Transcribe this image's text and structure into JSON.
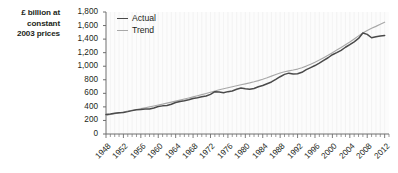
{
  "chart_data": {
    "type": "line",
    "title": "",
    "subtitle": "",
    "xlabel": "",
    "ylabel": "£ billion at constant 2003 prices",
    "ylabel_lines": [
      "£ billion at",
      "constant",
      "2003 prices"
    ],
    "ylim": [
      0,
      1800
    ],
    "ytick_step": 200,
    "ytick_labels": [
      "0",
      "200",
      "400",
      "600",
      "800",
      "1,000",
      "1,200",
      "1,400",
      "1,600",
      "1,800"
    ],
    "ytick_values": [
      0,
      200,
      400,
      600,
      800,
      1000,
      1200,
      1400,
      1600,
      1800
    ],
    "xlim": [
      1948,
      2013
    ],
    "xtick_labels": [
      "1948",
      "1952",
      "1956",
      "1960",
      "1964",
      "1968",
      "1972",
      "1976",
      "1980",
      "1984",
      "1988",
      "1992",
      "1996",
      "2000",
      "2004",
      "2008",
      "2012"
    ],
    "xtick_values": [
      1948,
      1952,
      1956,
      1960,
      1964,
      1968,
      1972,
      1976,
      1980,
      1984,
      1988,
      1992,
      1996,
      2000,
      2004,
      2008,
      2012
    ],
    "xtick_minor_step": 1,
    "grid": "vertical-faint",
    "legend_position": "top-left-inside",
    "legend": [
      "Actual",
      "Trend"
    ],
    "colors": {
      "actual": "#4a4a4a",
      "trend": "#a8a8a8",
      "axis": "#6e6e6e",
      "grid": "#ededed",
      "plot_background": "#fcfcfc",
      "text": "#231f20"
    },
    "x": [
      1948,
      1949,
      1950,
      1951,
      1952,
      1953,
      1954,
      1955,
      1956,
      1957,
      1958,
      1959,
      1960,
      1961,
      1962,
      1963,
      1964,
      1965,
      1966,
      1967,
      1968,
      1969,
      1970,
      1971,
      1972,
      1973,
      1974,
      1975,
      1976,
      1977,
      1978,
      1979,
      1980,
      1981,
      1982,
      1983,
      1984,
      1985,
      1986,
      1987,
      1988,
      1989,
      1990,
      1991,
      1992,
      1993,
      1994,
      1995,
      1996,
      1997,
      1998,
      1999,
      2000,
      2001,
      2002,
      2003,
      2004,
      2005,
      2006,
      2007,
      2008,
      2009,
      2010,
      2011,
      2012
    ],
    "series": [
      {
        "name": "Actual",
        "values": [
          288,
          295,
          305,
          315,
          318,
          330,
          345,
          358,
          362,
          368,
          370,
          385,
          405,
          415,
          420,
          440,
          465,
          480,
          490,
          505,
          525,
          535,
          548,
          560,
          585,
          625,
          618,
          610,
          625,
          635,
          660,
          680,
          668,
          660,
          672,
          697,
          715,
          742,
          768,
          805,
          845,
          880,
          898,
          885,
          888,
          910,
          950,
          980,
          1010,
          1045,
          1085,
          1125,
          1170,
          1200,
          1235,
          1280,
          1320,
          1360,
          1410,
          1490,
          1470,
          1420,
          1435,
          1445,
          1452
        ]
      },
      {
        "name": "Trend",
        "values": [
          275,
          288,
          300,
          312,
          325,
          338,
          350,
          362,
          375,
          388,
          400,
          413,
          427,
          440,
          455,
          470,
          485,
          500,
          516,
          532,
          548,
          564,
          581,
          598,
          616,
          634,
          652,
          668,
          683,
          698,
          712,
          726,
          740,
          754,
          770,
          788,
          808,
          830,
          854,
          878,
          900,
          918,
          932,
          944,
          958,
          978,
          1002,
          1030,
          1060,
          1092,
          1126,
          1162,
          1200,
          1238,
          1276,
          1316,
          1358,
          1402,
          1448,
          1492,
          1528,
          1560,
          1588,
          1618,
          1650
        ]
      }
    ]
  }
}
